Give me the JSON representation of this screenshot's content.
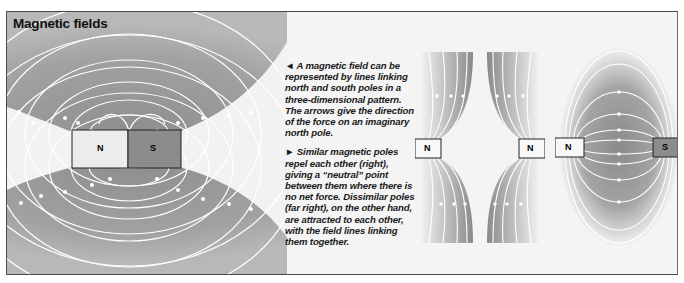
{
  "title": "Magnetic fields",
  "caption": {
    "paragraph1": "◄ A magnetic field can be represented by lines linking north and south poles in a three-dimensional pattern. The arrows give the direction of the force on an imaginary north pole.",
    "paragraph2": "► Similar magnetic poles repel each other (right), giving a “neutral” point between them where there is no net force. Dissimilar poles (far right), on the other hand, are attracted to each other, with the field lines linking them together."
  },
  "diagrams": {
    "bar_magnet": {
      "north_label": "N",
      "south_label": "S"
    },
    "repelling": {
      "left_label": "N",
      "right_label": "N"
    },
    "attracting": {
      "left_label": "N",
      "right_label": "S"
    }
  },
  "colors": {
    "field_gray": "#9a9a9a",
    "north_fill": "#ececec",
    "south_fill": "#8c8c8c",
    "line": "#ffffff"
  }
}
